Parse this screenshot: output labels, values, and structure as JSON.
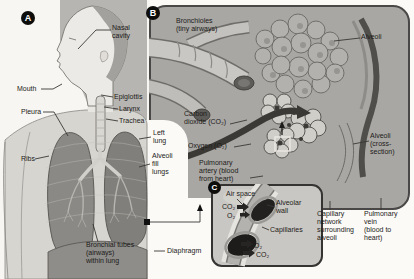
{
  "panelA": {
    "badge": "A",
    "labels": {
      "nasal_cavity": "Nasal\ncavity",
      "mouth": "Mouth",
      "epiglottis": "Epiglottis",
      "larynx": "Larynx",
      "trachea": "Trachea",
      "pleura": "Pleura",
      "ribs": "Ribs",
      "left_lung": "Left\nlung",
      "alveoli_fill_lungs": "Alveoli\nfill\nlungs",
      "bronchial_tubes": "Bronchial tubes\n(airways)\nwithin lung",
      "diaphragm": "Diaphragm"
    }
  },
  "panelB": {
    "badge": "B",
    "labels": {
      "bronchioles": "Bronchioles\n(tiny airways)",
      "alveoli": "Alveoli",
      "carbon_dioxide": "Carbon\ndioxide (CO₂)",
      "oxygen": "Oxygen (O₂)",
      "pulmonary_artery": "Pulmonary\nartery (blood\nfrom heart)",
      "alveoli_cross_section": "Alveoli\n(cross-\nsection)",
      "capillary_network": "Capillary\nnetwork\nsurrounding\nalveoli",
      "pulmonary_vein": "Pulmonary\nvein\n(blood to\nheart)"
    }
  },
  "panelC": {
    "badge": "C",
    "labels": {
      "air_space": "Air space",
      "co2_in": "CO₂",
      "o2_in": "O₂",
      "alveolar_wall": "Alveolar\nwall",
      "capillaries": "Capillaries",
      "o2_out": "O₂",
      "co2_out": "CO₂"
    }
  },
  "colors": {
    "panel_b_bg": "#a9a7a4",
    "panel_c_bg": "#c9c7c3",
    "badge_bg": "#0d0d0c",
    "badge_text": "#ffffff",
    "label_text": "#1c1b19",
    "leader_line": "#3a3836",
    "dark_vessel": "#3b3935"
  }
}
